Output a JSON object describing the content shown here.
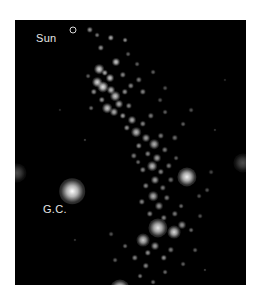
{
  "figure": {
    "background": "#000000",
    "labels": {
      "sun": "Sun",
      "galactic_center": "G.C."
    },
    "stars": [
      [
        57,
        171,
        8,
        1.0
      ],
      [
        105,
        269,
        6,
        0.95
      ],
      [
        172,
        157,
        6,
        0.95
      ],
      [
        143,
        208,
        6,
        0.9
      ],
      [
        159,
        212,
        4,
        0.85
      ],
      [
        128,
        220,
        4,
        0.8
      ],
      [
        75,
        10,
        2,
        0.6
      ],
      [
        82,
        15,
        1.5,
        0.5
      ],
      [
        96,
        18,
        2,
        0.7
      ],
      [
        110,
        20,
        1.5,
        0.6
      ],
      [
        86,
        28,
        2,
        0.6
      ],
      [
        101,
        42,
        2.5,
        0.8
      ],
      [
        84,
        49,
        3,
        0.85
      ],
      [
        90,
        53,
        2,
        0.7
      ],
      [
        95,
        58,
        2.5,
        0.8
      ],
      [
        82,
        62,
        3,
        0.85
      ],
      [
        88,
        67,
        3.5,
        0.9
      ],
      [
        96,
        70,
        2.5,
        0.75
      ],
      [
        79,
        72,
        2,
        0.6
      ],
      [
        100,
        76,
        3,
        0.8
      ],
      [
        87,
        80,
        2,
        0.6
      ],
      [
        104,
        84,
        2.5,
        0.7
      ],
      [
        110,
        72,
        2,
        0.6
      ],
      [
        116,
        66,
        2,
        0.55
      ],
      [
        124,
        60,
        2,
        0.5
      ],
      [
        128,
        72,
        2,
        0.55
      ],
      [
        92,
        88,
        3,
        0.8
      ],
      [
        99,
        92,
        2.5,
        0.7
      ],
      [
        108,
        96,
        2,
        0.65
      ],
      [
        117,
        100,
        2.5,
        0.7
      ],
      [
        112,
        108,
        2,
        0.6
      ],
      [
        121,
        112,
        3,
        0.75
      ],
      [
        128,
        104,
        2,
        0.55
      ],
      [
        136,
        96,
        2,
        0.5
      ],
      [
        131,
        118,
        2.5,
        0.65
      ],
      [
        124,
        126,
        2,
        0.6
      ],
      [
        139,
        124,
        3,
        0.7
      ],
      [
        146,
        116,
        2,
        0.5
      ],
      [
        133,
        134,
        2,
        0.55
      ],
      [
        142,
        138,
        2.5,
        0.65
      ],
      [
        150,
        130,
        2,
        0.5
      ],
      [
        137,
        146,
        3,
        0.75
      ],
      [
        128,
        150,
        2,
        0.55
      ],
      [
        146,
        152,
        2,
        0.55
      ],
      [
        154,
        146,
        2,
        0.5
      ],
      [
        140,
        160,
        2.5,
        0.65
      ],
      [
        131,
        166,
        2,
        0.55
      ],
      [
        148,
        168,
        2,
        0.5
      ],
      [
        156,
        160,
        2,
        0.45
      ],
      [
        138,
        176,
        3,
        0.7
      ],
      [
        127,
        182,
        2,
        0.55
      ],
      [
        144,
        186,
        2.5,
        0.6
      ],
      [
        152,
        178,
        2,
        0.5
      ],
      [
        135,
        194,
        2,
        0.55
      ],
      [
        149,
        198,
        2,
        0.55
      ],
      [
        160,
        194,
        2,
        0.5
      ],
      [
        166,
        186,
        1.5,
        0.45
      ],
      [
        140,
        226,
        2.5,
        0.65
      ],
      [
        133,
        233,
        2,
        0.6
      ],
      [
        149,
        238,
        2,
        0.6
      ],
      [
        120,
        238,
        2,
        0.55
      ],
      [
        131,
        246,
        2,
        0.55
      ],
      [
        156,
        230,
        2,
        0.5
      ],
      [
        125,
        256,
        1.5,
        0.5
      ],
      [
        138,
        262,
        1.5,
        0.45
      ],
      [
        150,
        252,
        1.5,
        0.45
      ],
      [
        168,
        244,
        1.5,
        0.4
      ],
      [
        180,
        230,
        1.5,
        0.4
      ],
      [
        100,
        240,
        1.5,
        0.4
      ],
      [
        96,
        214,
        1.5,
        0.35
      ],
      [
        110,
        226,
        1.5,
        0.45
      ],
      [
        167,
        205,
        2.5,
        0.6
      ],
      [
        176,
        210,
        1.5,
        0.45
      ],
      [
        184,
        176,
        1.5,
        0.35
      ],
      [
        192,
        170,
        1.5,
        0.35
      ],
      [
        160,
        118,
        2,
        0.45
      ],
      [
        168,
        104,
        1.5,
        0.4
      ],
      [
        176,
        90,
        1.5,
        0.35
      ],
      [
        150,
        92,
        1.5,
        0.4
      ],
      [
        145,
        80,
        1.5,
        0.35
      ],
      [
        138,
        52,
        1.5,
        0.4
      ],
      [
        150,
        68,
        1.5,
        0.35
      ],
      [
        122,
        44,
        1.5,
        0.4
      ],
      [
        113,
        34,
        1.5,
        0.4
      ],
      [
        108,
        55,
        2,
        0.55
      ],
      [
        76,
        88,
        1.5,
        0.45
      ],
      [
        73,
        56,
        1.5,
        0.4
      ],
      [
        114,
        86,
        2,
        0.55
      ],
      [
        119,
        136,
        2,
        0.5
      ],
      [
        123,
        142,
        1.5,
        0.45
      ],
      [
        161,
        138,
        1.5,
        0.4
      ],
      [
        185,
        196,
        1.5,
        0.35
      ],
      [
        196,
        152,
        1.5,
        0.3
      ],
      [
        70,
        120,
        1,
        0.3
      ],
      [
        200,
        110,
        1,
        0.25
      ],
      [
        60,
        220,
        1,
        0.25
      ],
      [
        190,
        250,
        1,
        0.3
      ],
      [
        45,
        90,
        1,
        0.2
      ],
      [
        210,
        60,
        1,
        0.2
      ]
    ],
    "edge_glows": [
      [
        2,
        153,
        6,
        0.3
      ],
      [
        228,
        143,
        6,
        0.3
      ]
    ]
  }
}
